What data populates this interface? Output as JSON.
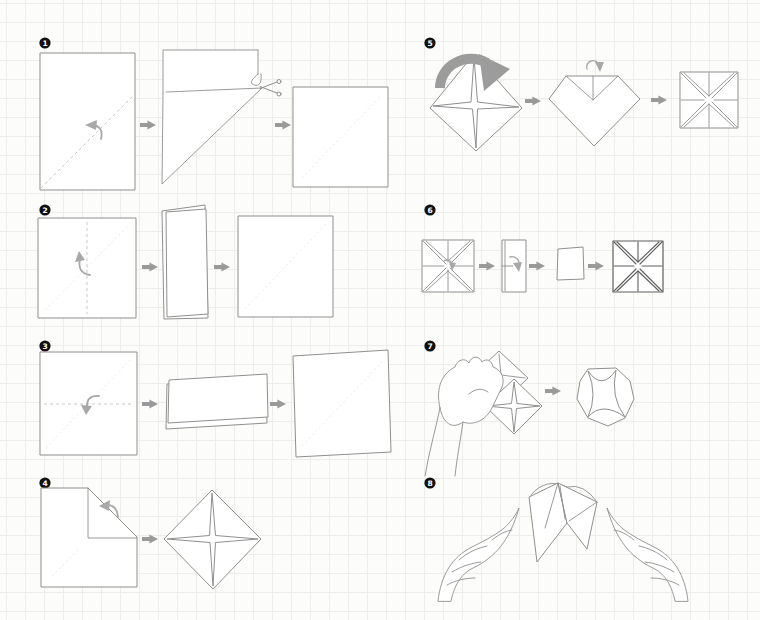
{
  "steps": [
    {
      "number": "1",
      "stages": [
        "rectangle-with-diagonal-valley-fold",
        "fold-and-cut-strip-with-scissors",
        "square-result"
      ]
    },
    {
      "number": "2",
      "stages": [
        "square-vertical-valley-fold",
        "folded-in-half-vertically",
        "unfolded-square"
      ]
    },
    {
      "number": "3",
      "stages": [
        "square-horizontal-valley-fold",
        "folded-in-half-horizontally",
        "unfolded-square"
      ]
    },
    {
      "number": "4",
      "stages": [
        "square-corner-folded-to-center",
        "all-corners-folded-diamond"
      ]
    },
    {
      "number": "5",
      "stages": [
        "flip-model-over",
        "fold-corner-to-center",
        "all-corners-folded-square"
      ]
    },
    {
      "number": "6",
      "stages": [
        "creased-square",
        "fold-in-half",
        "small-square",
        "creased-square"
      ]
    },
    {
      "number": "7",
      "stages": [
        "hand-pushing-pockets-open",
        "opened-fortune-teller-top-view"
      ]
    },
    {
      "number": "8",
      "stages": [
        "two-hands-operating-fortune-teller"
      ]
    }
  ],
  "icons": {
    "arrow_right": "right-flow-arrow",
    "fold_arrow": "curved-fold-arrow",
    "flip_arrow": "thick-flip-over-arrow",
    "scissors": "scissors-cut"
  },
  "colors": {
    "background": "#fcfcfa",
    "grid_line": "#ededea",
    "outline": "#8f8f8f",
    "outline_dark": "#5f5f5f",
    "dashed": "#c8c8c8",
    "crease": "#e8e6e1",
    "fold_arrow": "#a8a8a8",
    "flow_arrow": "#9a9a9a",
    "flip_arrow": "#9c9c9c",
    "badge_bg": "#111111",
    "badge_text": "#ffffff",
    "paper_fill": "#ffffff"
  }
}
